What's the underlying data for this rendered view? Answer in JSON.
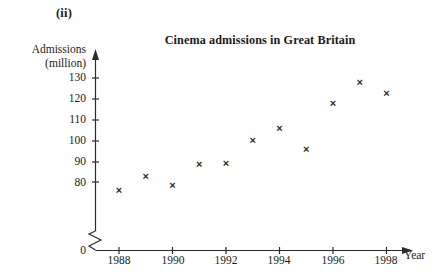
{
  "figure": {
    "index_label": "(ii)",
    "title": "Cinema admissions in Great Britain",
    "y_axis_title_line1": "Admissions",
    "y_axis_title_line2": "(million)",
    "x_axis_title": "Year",
    "origin_label": "0",
    "axis_break": "zigzag-break",
    "marker_glyph": "×"
  },
  "chart_data": {
    "type": "scatter",
    "title": "Cinema admissions in Great Britain",
    "xlabel": "Year",
    "ylabel": "Admissions (million)",
    "x": [
      1988,
      1989,
      1990,
      1991,
      1992,
      1993,
      1994,
      1995,
      1996,
      1997,
      1998
    ],
    "values": [
      76,
      83,
      78.5,
      88.5,
      89,
      100,
      106,
      96,
      118,
      128,
      123
    ],
    "xlim": [
      1987,
      1999
    ],
    "ylim": [
      80,
      135
    ],
    "y_axis_broken": true,
    "y_break_between": [
      0,
      80
    ],
    "yticks": [
      80,
      90,
      100,
      110,
      120,
      130
    ],
    "ytick_labels": [
      "80",
      "90",
      "100",
      "110",
      "120",
      "130"
    ],
    "xticks": [
      1988,
      1990,
      1992,
      1994,
      1996,
      1998
    ],
    "xtick_labels": [
      "1988",
      "1990",
      "1992",
      "1994",
      "1996",
      "1998"
    ],
    "grid": false,
    "legend": null,
    "marker": "x",
    "marker_color": "#2b2b2b",
    "axis_color": "#2b2b2b"
  }
}
